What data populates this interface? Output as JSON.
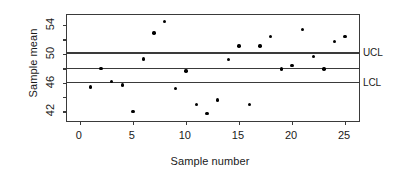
{
  "chart_data": {
    "type": "scatter",
    "title": "",
    "xlabel": "Sample number",
    "ylabel": "Sample mean",
    "xlim": [
      -1.2,
      26.5
    ],
    "ylim": [
      40.4,
      55.4
    ],
    "x": [
      1,
      2,
      3,
      4,
      5,
      6,
      7,
      8,
      9,
      10,
      11,
      12,
      13,
      14,
      15,
      16,
      17,
      18,
      19,
      20,
      21,
      22,
      23,
      24,
      25
    ],
    "values": [
      45.4,
      48.0,
      46.2,
      45.7,
      42.0,
      49.3,
      52.9,
      54.5,
      45.2,
      47.6,
      43.0,
      41.7,
      43.6,
      49.2,
      51.1,
      43.0,
      51.1,
      52.4,
      47.9,
      48.4,
      53.4,
      49.6,
      47.9,
      51.7,
      52.4
    ],
    "series": [
      {
        "name": "Sample mean",
        "values": [
          45.4,
          48.0,
          46.2,
          45.7,
          42.0,
          49.3,
          52.9,
          54.5,
          45.2,
          47.6,
          43.0,
          41.7,
          43.6,
          49.2,
          51.1,
          43.0,
          51.1,
          52.4,
          47.9,
          48.4,
          53.4,
          49.6,
          47.9,
          51.7,
          52.4
        ]
      }
    ],
    "xticks": [
      0,
      5,
      10,
      15,
      20,
      25
    ],
    "xtick_labels": [
      "0",
      "5",
      "10",
      "15",
      "20",
      "25"
    ],
    "yticks": [
      42,
      44,
      46,
      48,
      50,
      52,
      54
    ],
    "ytick_labels": [
      "42",
      "",
      "46",
      "",
      "50",
      "",
      "54"
    ],
    "ytick_labels_shown": [
      "42",
      "46",
      "50",
      "54"
    ],
    "grid": false,
    "legend": "none",
    "marker": "filled-circle",
    "marker_color": "#000000",
    "axis_color": "#3a3a3a",
    "background": "#ffffff",
    "control_limits": [
      {
        "name": "UCL",
        "label": "UCL",
        "value": 50.1
      },
      {
        "name": "CL",
        "label": "",
        "value": 48.0
      },
      {
        "name": "LCL",
        "label": "LCL",
        "value": 46.0
      }
    ],
    "annotations": [
      {
        "text": "UCL",
        "value": 50.1
      },
      {
        "text": "LCL",
        "value": 46.0
      }
    ]
  }
}
